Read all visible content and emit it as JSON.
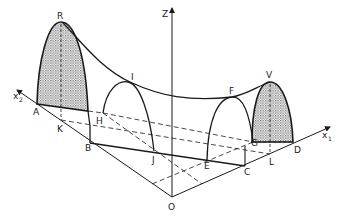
{
  "diagram": {
    "axes": {
      "z": "Z",
      "x1": {
        "base": "x",
        "sub": "1"
      },
      "x2": {
        "base": "x",
        "sub": "2"
      },
      "origin": "O"
    },
    "points": {
      "R": "R",
      "A": "A",
      "K": "K",
      "B": "B",
      "H": "H",
      "I": "I",
      "J": "J",
      "E": "E",
      "F": "F",
      "G": "G",
      "C": "C",
      "L": "L",
      "D": "D",
      "V": "V"
    },
    "colors": {
      "line": "#1a1a1a",
      "shade": "#b8b8b8"
    }
  }
}
